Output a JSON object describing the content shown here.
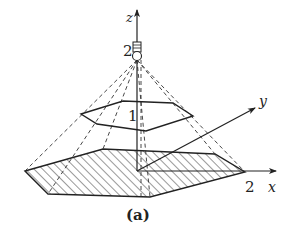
{
  "figure": {
    "caption": "(a)",
    "axes": {
      "x_label": "x",
      "y_label": "y",
      "z_label": "z",
      "x_tick": "2",
      "z_tick": "2"
    },
    "upper_polygon_label": "1",
    "light_source": "light-bulb",
    "colors": {
      "stroke": "#222222",
      "hatch": "#333333",
      "background": "#ffffff"
    }
  }
}
